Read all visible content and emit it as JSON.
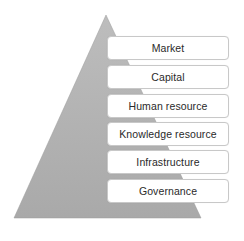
{
  "diagram": {
    "type": "pyramid",
    "pyramid_color": "#b3b3b3",
    "layers": [
      {
        "label": "Market"
      },
      {
        "label": "Capital"
      },
      {
        "label": "Human resource"
      },
      {
        "label": "Knowledge resource"
      },
      {
        "label": "Infrastructure"
      },
      {
        "label": "Governance"
      }
    ]
  }
}
